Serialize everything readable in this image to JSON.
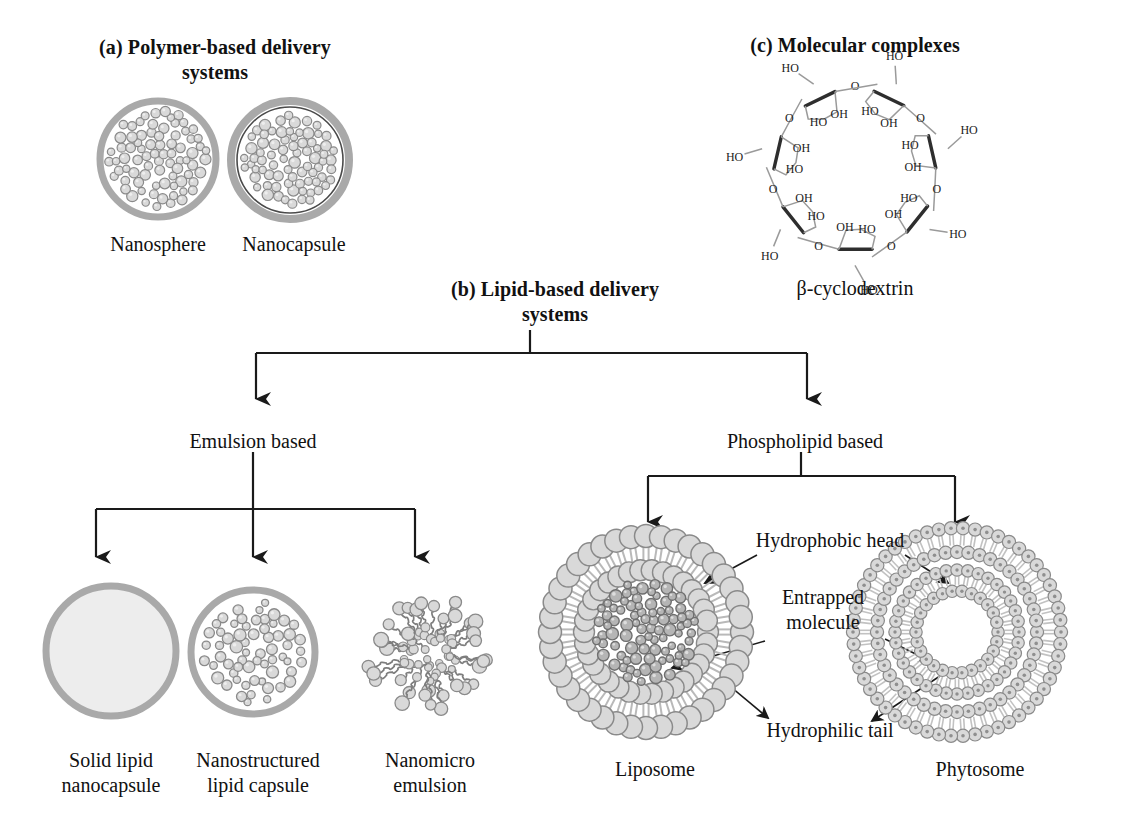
{
  "figure": {
    "domain_kind": "scientific-diagram",
    "background": "#ffffff"
  },
  "panels": {
    "a": {
      "title": "(a) Polymer-based delivery\nsystems",
      "title_line1": "(a) Polymer-based delivery",
      "title_line2": "systems",
      "structures": [
        {
          "name": "nanosphere",
          "label": "Nanosphere"
        },
        {
          "name": "nanocapsule",
          "label": "Nanocapsule"
        }
      ]
    },
    "b": {
      "title_line1": "(b) Lipid-based delivery",
      "title_line2": "systems",
      "branches": [
        {
          "name": "emulsion-based",
          "label": "Emulsion based"
        },
        {
          "name": "phospholipid-based",
          "label": "Phospholipid based"
        }
      ],
      "emulsion_children": [
        {
          "name": "solid-lipid-nanocapsule",
          "line1": "Solid lipid",
          "line2": "nanocapsule"
        },
        {
          "name": "nanostructured-lipid-capsule",
          "line1": "Nanostructured",
          "line2": "lipid capsule"
        },
        {
          "name": "nanomicro-emulsion",
          "line1": "Nanomicro",
          "line2": "emulsion"
        }
      ],
      "phospholipid_children": [
        {
          "name": "liposome",
          "label": "Liposome"
        },
        {
          "name": "phytosome",
          "label": "Phytosome"
        }
      ],
      "callouts": [
        {
          "name": "hydrophobic-head",
          "label": "Hydrophobic head"
        },
        {
          "name": "entrapped-molecule",
          "line1": "Entrapped",
          "line2": "molecule"
        },
        {
          "name": "hydrophilic-tail",
          "label": "Hydrophilic tail"
        }
      ]
    },
    "c": {
      "title": "(c) Molecular complexes",
      "molecule_label": "β-cyclodextrin",
      "molecule_name": "beta-cyclodextrin",
      "glucose_units": 7,
      "atom_labels": {
        "hydroxyl_left": "HO",
        "hydroxyl_right": "OH",
        "oxygen": "O"
      },
      "ring_labels": [
        "HO",
        "OH",
        "O",
        "OH",
        "HO",
        "O",
        "OH",
        "OH",
        "HO",
        "O",
        "OH",
        "HO",
        "O",
        "OH",
        "OH",
        "HO",
        "O",
        "OH",
        "HO",
        "O",
        "OH",
        "HO",
        "O",
        "OH",
        "HO",
        "O",
        "OH",
        "O"
      ]
    }
  },
  "colors": {
    "ink": "#1a1a1a",
    "shell_gray": "#a9a9a9",
    "sphere_fill": "#d9d9d9",
    "sphere_stroke": "#8a8a8a",
    "core_fill": "#b5b5b5",
    "core_stroke": "#6f6f6f",
    "solid_fill": "#ebebeb",
    "molecule_gray": "#9a9a9a"
  }
}
